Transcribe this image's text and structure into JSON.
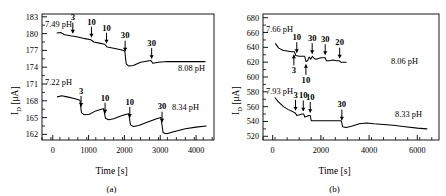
{
  "figure": {
    "panels": [
      {
        "caption": "(a)",
        "xlabel": "Time [s]",
        "ylabel_main": "I",
        "ylabel_sub": "D",
        "ylabel_unit": " [μA]"
      },
      {
        "caption": "(b)",
        "xlabel": "Time [s]",
        "ylabel_main": "I",
        "ylabel_sub": "D",
        "ylabel_unit": " [μA]"
      }
    ]
  },
  "chart_data": [
    {
      "type": "line",
      "panel": "(a)",
      "title": "",
      "xlabel": "Time [s]",
      "ylabel": "I_D [μA]",
      "xlim": [
        -300,
        4500
      ],
      "ylim": [
        161,
        183.5
      ],
      "xticks": [
        0,
        1000,
        2000,
        3000,
        4000
      ],
      "xtick_labels": [
        "0",
        "1000",
        "2000",
        "3000",
        "4000"
      ],
      "yticks": [
        162,
        165,
        168,
        171,
        174,
        177,
        180,
        183
      ],
      "ytick_labels": [
        "162",
        "165",
        "168",
        "171",
        "174",
        "177",
        "180",
        "183"
      ],
      "grid": false,
      "legend": false,
      "series": [
        {
          "name": "upper-trace",
          "start_label": "7.49 pH",
          "end_label": "8.08 pH",
          "points": [
            [
              120,
              180.1
            ],
            [
              220,
              180.2
            ],
            [
              330,
              179.8
            ],
            [
              500,
              179.6
            ],
            [
              700,
              179.4
            ],
            [
              900,
              179.1
            ],
            [
              1060,
              178.9
            ],
            [
              1150,
              178.5
            ],
            [
              1300,
              178.3
            ],
            [
              1450,
              178.1
            ],
            [
              1520,
              177.6
            ],
            [
              1700,
              177.4
            ],
            [
              1900,
              177.1
            ],
            [
              2010,
              176.9
            ],
            [
              2050,
              174.6
            ],
            [
              2120,
              174.2
            ],
            [
              2250,
              174.3
            ],
            [
              2450,
              174.9
            ],
            [
              2650,
              175.1
            ],
            [
              2740,
              175.2
            ],
            [
              2790,
              174.7
            ],
            [
              2950,
              174.9
            ],
            [
              3200,
              175.0
            ],
            [
              3700,
              175.0
            ],
            [
              4250,
              175.0
            ]
          ],
          "injections": [
            {
              "time": 560,
              "label": "3",
              "position": "above"
            },
            {
              "time": 1080,
              "label": "10",
              "position": "above"
            },
            {
              "time": 1500,
              "label": "10",
              "position": "above"
            },
            {
              "time": 2020,
              "label": "30",
              "position": "above"
            },
            {
              "time": 2760,
              "label": "30",
              "position": "above"
            }
          ]
        },
        {
          "name": "lower-trace",
          "start_label": "7.22 pH",
          "end_label": "8.34 pH",
          "points": [
            [
              130,
              168.7
            ],
            [
              250,
              168.9
            ],
            [
              400,
              168.7
            ],
            [
              600,
              168.4
            ],
            [
              760,
              168.1
            ],
            [
              800,
              165.9
            ],
            [
              880,
              165.5
            ],
            [
              1020,
              165.6
            ],
            [
              1200,
              166.2
            ],
            [
              1350,
              166.5
            ],
            [
              1420,
              166.6
            ],
            [
              1470,
              164.9
            ],
            [
              1560,
              164.6
            ],
            [
              1700,
              164.8
            ],
            [
              1900,
              165.3
            ],
            [
              2050,
              165.6
            ],
            [
              2120,
              165.7
            ],
            [
              2170,
              163.7
            ],
            [
              2250,
              163.4
            ],
            [
              2400,
              163.6
            ],
            [
              2650,
              164.2
            ],
            [
              2900,
              164.8
            ],
            [
              3020,
              165.0
            ],
            [
              3080,
              162.3
            ],
            [
              3180,
              162.1
            ],
            [
              3400,
              162.5
            ],
            [
              3700,
              163.0
            ],
            [
              4000,
              163.3
            ],
            [
              4280,
              163.5
            ]
          ],
          "injections": [
            {
              "time": 790,
              "label": "3",
              "position": "above"
            },
            {
              "time": 1460,
              "label": "10",
              "position": "above"
            },
            {
              "time": 2150,
              "label": "10",
              "position": "above"
            },
            {
              "time": 3050,
              "label": "30",
              "position": "above"
            }
          ]
        }
      ]
    },
    {
      "type": "line",
      "panel": "(b)",
      "title": "",
      "xlabel": "Time [s]",
      "ylabel": "I_D [μA]",
      "xlim": [
        -400,
        6900
      ],
      "ylim": [
        515,
        685
      ],
      "xticks": [
        0,
        2000,
        4000,
        6000
      ],
      "xtick_labels": [
        "0",
        "2000",
        "4000",
        "6000"
      ],
      "yticks": [
        520,
        540,
        560,
        580,
        600,
        620,
        640,
        660,
        680
      ],
      "ytick_labels": [
        "520",
        "540",
        "560",
        "580",
        "600",
        "620",
        "640",
        "660",
        "680"
      ],
      "grid": false,
      "legend": false,
      "series": [
        {
          "name": "upper-trace",
          "start_label": "7.66 pH",
          "end_label": "8.06 pH",
          "points": [
            [
              120,
              645
            ],
            [
              250,
              639
            ],
            [
              420,
              636
            ],
            [
              600,
              635
            ],
            [
              800,
              634
            ],
            [
              900,
              634
            ],
            [
              960,
              629
            ],
            [
              1100,
              628
            ],
            [
              1250,
              628
            ],
            [
              1330,
              628
            ],
            [
              1380,
              621
            ],
            [
              1450,
              622
            ],
            [
              1520,
              627
            ],
            [
              1580,
              624
            ],
            [
              1650,
              628
            ],
            [
              1720,
              625
            ],
            [
              1800,
              624
            ],
            [
              1900,
              625
            ],
            [
              2000,
              626
            ],
            [
              2100,
              626
            ],
            [
              2180,
              626
            ],
            [
              2230,
              622
            ],
            [
              2350,
              622
            ],
            [
              2500,
              623
            ],
            [
              2650,
              622
            ],
            [
              2760,
              622
            ],
            [
              2820,
              620
            ],
            [
              2950,
              620
            ],
            [
              3050,
              620
            ]
          ],
          "injections": [
            {
              "time": 880,
              "label": "3",
              "position": "below"
            },
            {
              "time": 1000,
              "label": "10",
              "position": "above"
            },
            {
              "time": 1380,
              "label": "10",
              "position": "below"
            },
            {
              "time": 1640,
              "label": "30",
              "position": "above"
            },
            {
              "time": 2180,
              "label": "30",
              "position": "above"
            },
            {
              "time": 2780,
              "label": "20",
              "position": "above"
            }
          ]
        },
        {
          "name": "lower-trace",
          "start_label": "7.93 pH",
          "end_label": "8.33 pH",
          "points": [
            [
              100,
              572
            ],
            [
              250,
              566
            ],
            [
              450,
              560
            ],
            [
              650,
              556
            ],
            [
              850,
              553
            ],
            [
              950,
              551
            ],
            [
              1000,
              548
            ],
            [
              1120,
              549
            ],
            [
              1220,
              550
            ],
            [
              1290,
              550
            ],
            [
              1330,
              546
            ],
            [
              1430,
              547
            ],
            [
              1500,
              548
            ],
            [
              1560,
              548
            ],
            [
              1600,
              541
            ],
            [
              1750,
              541
            ],
            [
              1950,
              541
            ],
            [
              2200,
              541
            ],
            [
              2450,
              541
            ],
            [
              2700,
              541
            ],
            [
              2850,
              541
            ],
            [
              2900,
              533
            ],
            [
              3050,
              532
            ],
            [
              3300,
              534
            ],
            [
              3600,
              537
            ],
            [
              3900,
              538
            ],
            [
              4200,
              537
            ],
            [
              4600,
              536
            ],
            [
              5000,
              535
            ],
            [
              5500,
              533
            ],
            [
              6000,
              531
            ],
            [
              6400,
              530
            ]
          ],
          "injections": [
            {
              "time": 950,
              "label": "3",
              "position": "above"
            },
            {
              "time": 1270,
              "label": "10",
              "position": "above"
            },
            {
              "time": 1560,
              "label": "10",
              "position": "above"
            },
            {
              "time": 2870,
              "label": "30",
              "position": "above"
            }
          ]
        }
      ]
    }
  ]
}
